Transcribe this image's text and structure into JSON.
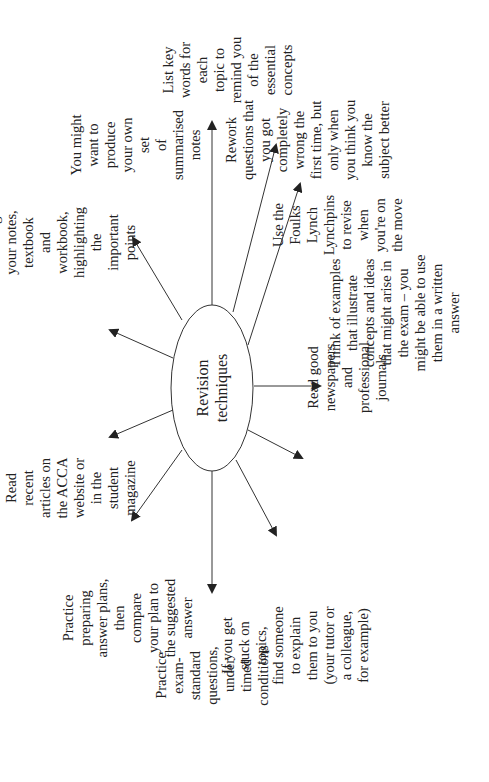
{
  "diagram": {
    "type": "mind-map",
    "center": {
      "label": "Revision\ntechniques"
    },
    "nodes": [
      {
        "id": "key-words",
        "label": "List key words for each\ntopic to remind you of the\nessential concepts"
      },
      {
        "id": "rework",
        "label": "Rework questions that\nyou got completely\nwrong the first time, but\nonly when you think you\nknow the subject better"
      },
      {
        "id": "lynchpins",
        "label": "Use the Foulks\nLynch Lynchpins\nto revise when\nyou're on the move"
      },
      {
        "id": "examples",
        "label": "Think of examples\nthat illustrate\nconcepts and ideas\nthat might arise in\nthe exam – you\nmight be able to use\nthem in a written\nanswer"
      },
      {
        "id": "newspapers",
        "label": "Read good\nnewspapers and\nprofessional\njournals"
      },
      {
        "id": "stuck",
        "label": "If you get stuck on topics,\nfind someone to explain\nthem to you (your tutor or\na colleague, for example)"
      },
      {
        "id": "exam-standard",
        "label": "Practice exam-standard\nquestions, under timed\nconditions"
      },
      {
        "id": "answer-plans",
        "label": "Practice preparing\nanswer plans, then\ncompare your plan to\nthe suggested answer"
      },
      {
        "id": "articles",
        "label": "Read recent articles on\nthe ACCA website or\nin the student magazine"
      },
      {
        "id": "go-through",
        "label": "Go through your notes,\ntextbook and workbook,\nhighlighting the\nimportant points"
      },
      {
        "id": "summarised",
        "label": "You might want to\nproduce your own set\nof summarised notes"
      }
    ]
  }
}
